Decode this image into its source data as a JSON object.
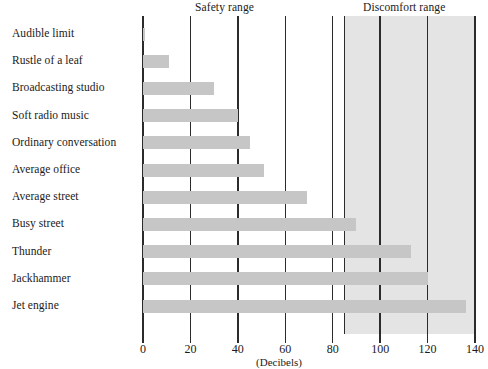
{
  "chart_data": {
    "type": "bar",
    "orientation": "horizontal",
    "title": "",
    "xlabel": "(Decibels)",
    "ylabel": "",
    "xlim": [
      0,
      140
    ],
    "xticks": [
      0,
      20,
      40,
      60,
      80,
      100,
      120,
      140
    ],
    "grid": true,
    "legend": "none",
    "categories": [
      "Audible limit",
      "Rustle of a leaf",
      "Broadcasting studio",
      "Soft radio music",
      "Ordinary conversation",
      "Average office",
      "Average street",
      "Busy street",
      "Thunder",
      "Jackhammer",
      "Jet engine"
    ],
    "values": [
      1,
      11,
      30,
      40,
      45,
      51,
      69,
      90,
      113,
      120,
      136
    ],
    "annotations": [
      {
        "label": "Safety range",
        "start": 0,
        "end": 85
      },
      {
        "label": "Discomfort range",
        "start": 85,
        "end": 140
      }
    ],
    "shaded_region": {
      "label": "Discomfort range",
      "start": 85,
      "end": 140,
      "color": "#e4e4e4"
    },
    "bar_color": "#c6c6c6",
    "gridline_color": "#2b2b2b"
  },
  "axis": {
    "tick_labels": [
      "0",
      "20",
      "40",
      "60",
      "80",
      "100",
      "120",
      "140"
    ],
    "title": "(Decibels)"
  },
  "headers": {
    "safety": "Safety range",
    "discomfort": "Discomfort range"
  }
}
